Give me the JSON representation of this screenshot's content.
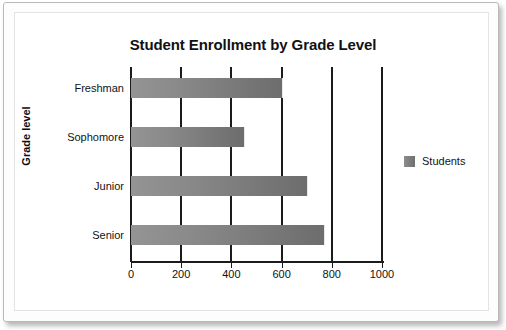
{
  "chart_data": {
    "type": "bar",
    "orientation": "horizontal",
    "title": "Student Enrollment by Grade Level",
    "xlabel": "",
    "ylabel": "Grade level",
    "categories": [
      "Freshman",
      "Sophomore",
      "Junior",
      "Senior"
    ],
    "values": [
      600,
      450,
      700,
      770
    ],
    "series": [
      {
        "name": "Students",
        "values": [
          600,
          450,
          700,
          770
        ]
      }
    ],
    "xlim": [
      0,
      1000
    ],
    "xticks": [
      0,
      200,
      400,
      600,
      800,
      1000
    ],
    "xtick_labels": [
      "0",
      "200",
      "400",
      "600",
      "800",
      "1000"
    ],
    "grid": true,
    "grid_axis": "x",
    "legend_position": "right",
    "legend_entries": [
      "Students"
    ],
    "colors": {
      "bar_light": "#949494",
      "bar_dark": "#6d6d6d",
      "axis": "#1b1b1b",
      "text": "#121212",
      "background": "#ffffff"
    }
  },
  "legend": {
    "entries": [
      {
        "label": "Students",
        "swatch": "legend-swatch-students"
      }
    ]
  }
}
